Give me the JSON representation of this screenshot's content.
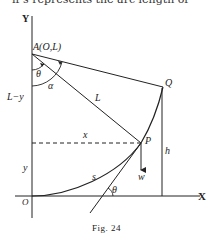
{
  "header_fragment": "if s represents the arc length of",
  "figure": {
    "caption": "Fig. 24",
    "axes": {
      "x_label": "X",
      "y_label": "Y",
      "origin_label": "O"
    },
    "points": {
      "A": "A(O,L)",
      "P": "P",
      "Q": "Q"
    },
    "labels": {
      "theta_top": "θ",
      "alpha": "α",
      "L_minus_y": "L−y",
      "L": "L",
      "x": "x",
      "y": "y",
      "h": "h",
      "w": "w",
      "s": "s",
      "theta_bottom": "θ"
    }
  }
}
